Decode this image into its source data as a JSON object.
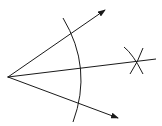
{
  "diagram": {
    "stroke_color": "#1a1a1a",
    "background": "#ffffff",
    "vertex": {
      "x": 8,
      "y": 77
    },
    "rays": [
      {
        "name": "upper-ray",
        "to": {
          "x": 105,
          "y": 10
        },
        "arrow": true
      },
      {
        "name": "lower-ray",
        "to": {
          "x": 118,
          "y": 118
        },
        "arrow": true
      },
      {
        "name": "bisector-ray",
        "to": {
          "x": 156,
          "y": 59
        },
        "arrow": false
      }
    ],
    "arcs": [
      {
        "name": "compass-arc-main",
        "from": {
          "x": 63,
          "y": 18
        },
        "via": {
          "x": 87,
          "y": 68
        },
        "to": {
          "x": 73,
          "y": 122
        }
      },
      {
        "name": "compass-arc-cross-1",
        "center": {
          "x": 137,
          "y": 61
        }
      },
      {
        "name": "compass-arc-cross-2",
        "center": {
          "x": 137,
          "y": 61
        }
      }
    ]
  }
}
